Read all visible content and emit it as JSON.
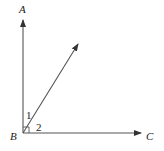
{
  "diagram": {
    "points": {
      "A": {
        "label": "A",
        "x": 23,
        "y": 10
      },
      "B": {
        "label": "B",
        "x": 14,
        "y": 140
      },
      "C": {
        "label": "C",
        "x": 151,
        "y": 140
      }
    },
    "angles": {
      "angle1": {
        "label": "1"
      },
      "angle2": {
        "label": "2"
      }
    },
    "rays": [
      {
        "name": "ray-BA",
        "from": "B",
        "to": "A"
      },
      {
        "name": "ray-BC",
        "from": "B",
        "to": "C"
      },
      {
        "name": "ray-diagonal",
        "from": "B",
        "direction": "up-right"
      }
    ],
    "right_angle_marker": true,
    "colors": {
      "line": "#444444",
      "text": "#222222"
    }
  }
}
